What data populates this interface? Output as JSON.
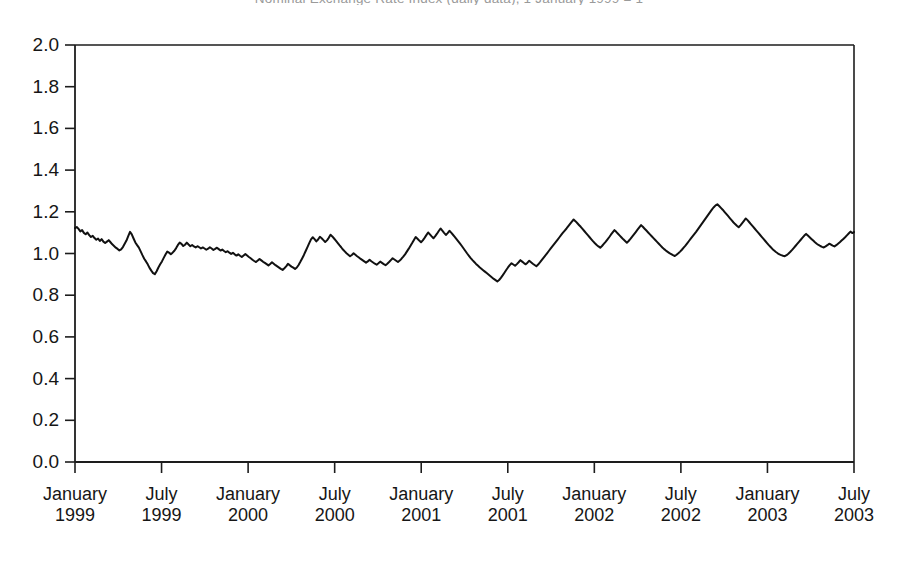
{
  "chart_title": "Nominal Exchange Rate Index (daily data), 1 January 1999 = 1",
  "chart_data": {
    "type": "line",
    "title": "Nominal Exchange Rate Index (daily data), 1 January 1999 = 1",
    "subtitle": "",
    "xlabel": "",
    "ylabel": "",
    "grid": false,
    "legend": "none",
    "line_color": "#111111",
    "line_width": 2.0,
    "xlim": [
      "1999-01",
      "2003-07"
    ],
    "ylim": [
      0.0,
      2.0
    ],
    "ytick_labels": [
      "0.0",
      "0.2",
      "0.4",
      "0.6",
      "0.8",
      "1.0",
      "1.2",
      "1.4",
      "1.6",
      "1.8",
      "2.0"
    ],
    "ytick_values": [
      0.0,
      0.2,
      0.4,
      0.6,
      0.8,
      1.0,
      1.2,
      1.4,
      1.6,
      1.8,
      2.0
    ],
    "xtick_labels": [
      {
        "month": "January",
        "year": "1999"
      },
      {
        "month": "July",
        "year": "1999"
      },
      {
        "month": "January",
        "year": "2000"
      },
      {
        "month": "July",
        "year": "2000"
      },
      {
        "month": "January",
        "year": "2001"
      },
      {
        "month": "July",
        "year": "2001"
      },
      {
        "month": "January",
        "year": "2002"
      },
      {
        "month": "July",
        "year": "2002"
      },
      {
        "month": "January",
        "year": "2003"
      },
      {
        "month": "July",
        "year": "2003"
      }
    ],
    "xtick_values": [
      0,
      0.5,
      1,
      1.5,
      2,
      2.5,
      3,
      3.5,
      4,
      4.5
    ],
    "series": [
      {
        "name": "Index",
        "x_start_year": 1999.0,
        "x_step_years": 0.017647,
        "values": [
          1.122,
          1.127,
          1.118,
          1.106,
          1.112,
          1.099,
          1.092,
          1.101,
          1.088,
          1.079,
          1.085,
          1.074,
          1.066,
          1.072,
          1.06,
          1.069,
          1.057,
          1.05,
          1.057,
          1.064,
          1.054,
          1.044,
          1.036,
          1.028,
          1.022,
          1.015,
          1.02,
          1.031,
          1.047,
          1.062,
          1.083,
          1.104,
          1.092,
          1.072,
          1.053,
          1.04,
          1.028,
          1.01,
          0.992,
          0.975,
          0.962,
          0.948,
          0.931,
          0.918,
          0.906,
          0.901,
          0.915,
          0.933,
          0.948,
          0.962,
          0.979,
          0.995,
          1.009,
          1.004,
          0.997,
          1.004,
          1.013,
          1.026,
          1.041,
          1.052,
          1.046,
          1.036,
          1.042,
          1.052,
          1.043,
          1.035,
          1.041,
          1.034,
          1.029,
          1.035,
          1.03,
          1.024,
          1.029,
          1.024,
          1.018,
          1.023,
          1.03,
          1.024,
          1.017,
          1.022,
          1.028,
          1.021,
          1.014,
          1.019,
          1.012,
          1.006,
          1.011,
          1.004,
          0.998,
          1.003,
          0.996,
          0.99,
          0.996,
          0.989,
          0.983,
          0.99,
          0.997,
          0.99,
          0.983,
          0.977,
          0.97,
          0.964,
          0.959,
          0.966,
          0.974,
          0.967,
          0.96,
          0.955,
          0.949,
          0.943,
          0.95,
          0.958,
          0.951,
          0.944,
          0.938,
          0.932,
          0.926,
          0.921,
          0.929,
          0.938,
          0.95,
          0.944,
          0.937,
          0.932,
          0.926,
          0.933,
          0.945,
          0.96,
          0.976,
          0.993,
          1.012,
          1.031,
          1.05,
          1.068,
          1.078,
          1.069,
          1.058,
          1.067,
          1.08,
          1.073,
          1.064,
          1.055,
          1.063,
          1.075,
          1.09,
          1.082,
          1.072,
          1.062,
          1.051,
          1.04,
          1.03,
          1.019,
          1.01,
          1.001,
          0.994,
          0.987,
          0.993,
          1.001,
          0.994,
          0.987,
          0.981,
          0.974,
          0.968,
          0.962,
          0.956,
          0.962,
          0.97,
          0.963,
          0.957,
          0.951,
          0.946,
          0.953,
          0.961,
          0.955,
          0.949,
          0.944,
          0.951,
          0.959,
          0.968,
          0.977,
          0.971,
          0.965,
          0.959,
          0.966,
          0.975,
          0.985,
          0.996,
          1.009,
          1.022,
          1.036,
          1.05,
          1.065,
          1.079,
          1.071,
          1.062,
          1.054,
          1.063,
          1.075,
          1.088,
          1.101,
          1.092,
          1.082,
          1.073,
          1.083,
          1.095,
          1.108,
          1.12,
          1.11,
          1.099,
          1.089,
          1.098,
          1.109,
          1.1,
          1.09,
          1.08,
          1.069,
          1.058,
          1.047,
          1.036,
          1.024,
          1.012,
          1.0,
          0.989,
          0.978,
          0.968,
          0.959,
          0.95,
          0.942,
          0.934,
          0.927,
          0.92,
          0.913,
          0.906,
          0.899,
          0.892,
          0.885,
          0.878,
          0.872,
          0.866,
          0.873,
          0.883,
          0.895,
          0.908,
          0.921,
          0.933,
          0.944,
          0.953,
          0.947,
          0.941,
          0.949,
          0.958,
          0.968,
          0.961,
          0.954,
          0.948,
          0.956,
          0.965,
          0.958,
          0.951,
          0.945,
          0.939,
          0.947,
          0.957,
          0.968,
          0.979,
          0.99,
          1.001,
          1.012,
          1.023,
          1.034,
          1.045,
          1.056,
          1.067,
          1.078,
          1.089,
          1.1,
          1.11,
          1.12,
          1.131,
          1.142,
          1.153,
          1.163,
          1.155,
          1.146,
          1.137,
          1.128,
          1.118,
          1.108,
          1.098,
          1.088,
          1.078,
          1.068,
          1.058,
          1.049,
          1.041,
          1.034,
          1.028,
          1.036,
          1.046,
          1.056,
          1.067,
          1.078,
          1.09,
          1.101,
          1.112,
          1.104,
          1.095,
          1.086,
          1.077,
          1.068,
          1.06,
          1.052,
          1.06,
          1.07,
          1.081,
          1.092,
          1.103,
          1.114,
          1.125,
          1.136,
          1.128,
          1.119,
          1.11,
          1.101,
          1.092,
          1.083,
          1.074,
          1.065,
          1.056,
          1.047,
          1.038,
          1.029,
          1.021,
          1.014,
          1.008,
          1.002,
          0.997,
          0.992,
          0.988,
          0.994,
          1.001,
          1.009,
          1.018,
          1.028,
          1.038,
          1.049,
          1.06,
          1.071,
          1.082,
          1.093,
          1.104,
          1.116,
          1.128,
          1.14,
          1.152,
          1.164,
          1.176,
          1.188,
          1.2,
          1.212,
          1.222,
          1.231,
          1.236,
          1.228,
          1.219,
          1.21,
          1.2,
          1.19,
          1.18,
          1.17,
          1.16,
          1.15,
          1.141,
          1.133,
          1.126,
          1.135,
          1.146,
          1.157,
          1.168,
          1.16,
          1.15,
          1.14,
          1.13,
          1.12,
          1.11,
          1.1,
          1.09,
          1.08,
          1.07,
          1.06,
          1.05,
          1.04,
          1.031,
          1.022,
          1.014,
          1.007,
          1.001,
          0.996,
          0.992,
          0.989,
          0.987,
          0.992,
          0.999,
          1.007,
          1.016,
          1.026,
          1.036,
          1.046,
          1.056,
          1.066,
          1.076,
          1.086,
          1.094,
          1.086,
          1.078,
          1.07,
          1.062,
          1.054,
          1.047,
          1.041,
          1.036,
          1.032,
          1.029,
          1.034,
          1.04,
          1.047,
          1.043,
          1.038,
          1.034,
          1.04,
          1.047,
          1.054,
          1.062,
          1.07,
          1.078,
          1.087,
          1.096,
          1.105,
          1.098,
          1.103
        ]
      }
    ],
    "annotations": {
      "start_value": 1.12,
      "min_value": 0.866,
      "min_label": "2001",
      "max_value": 1.236,
      "max_label": "2003",
      "end_value": 1.1
    }
  },
  "axes": {
    "plot_left_px": 75,
    "plot_right_px": 854,
    "plot_top_px": 45,
    "plot_bottom_px": 462
  }
}
